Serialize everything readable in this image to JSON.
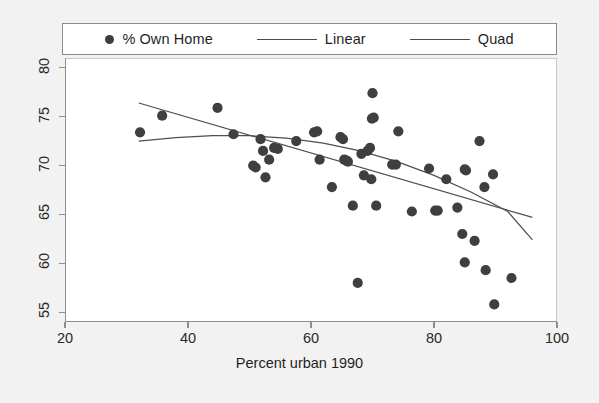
{
  "chart_data": {
    "type": "scatter",
    "title": "",
    "xlabel": "Percent urban 1990",
    "ylabel": "",
    "xlim": [
      20,
      100
    ],
    "ylim": [
      54,
      81
    ],
    "xticks": [
      20,
      40,
      60,
      80,
      100
    ],
    "yticks": [
      55,
      60,
      65,
      70,
      75,
      80
    ],
    "xtick_labels": [
      "20",
      "40",
      "60",
      "80",
      "100"
    ],
    "ytick_labels": [
      "55",
      "60",
      "65",
      "70",
      "75",
      "80"
    ],
    "grid": false,
    "legend_position": "top",
    "marker_color": "#3f3f3f",
    "line_color": "#4f4f4f",
    "background_color": "#ffffff",
    "page_background_color": "#f2f2f2",
    "series": [
      {
        "name": "% Own Home",
        "type": "scatter",
        "points": [
          [
            32.2,
            73.4
          ],
          [
            35.8,
            75.1
          ],
          [
            44.8,
            75.9
          ],
          [
            47.4,
            73.2
          ],
          [
            50.6,
            70.0
          ],
          [
            51.0,
            69.8
          ],
          [
            51.8,
            72.7
          ],
          [
            52.2,
            71.5
          ],
          [
            52.6,
            68.8
          ],
          [
            53.2,
            70.6
          ],
          [
            54.0,
            71.8
          ],
          [
            54.6,
            71.7
          ],
          [
            57.6,
            72.5
          ],
          [
            60.5,
            73.4
          ],
          [
            61.0,
            73.5
          ],
          [
            61.4,
            70.6
          ],
          [
            63.4,
            67.8
          ],
          [
            64.8,
            72.9
          ],
          [
            65.2,
            72.7
          ],
          [
            65.4,
            70.6
          ],
          [
            65.8,
            70.5
          ],
          [
            66.0,
            70.4
          ],
          [
            66.8,
            65.9
          ],
          [
            67.6,
            58.0
          ],
          [
            68.2,
            71.2
          ],
          [
            68.6,
            69.0
          ],
          [
            69.2,
            71.5
          ],
          [
            69.6,
            71.8
          ],
          [
            69.8,
            68.6
          ],
          [
            69.9,
            74.8
          ],
          [
            70.2,
            74.9
          ],
          [
            70.0,
            77.4
          ],
          [
            70.6,
            65.9
          ],
          [
            73.2,
            70.1
          ],
          [
            73.8,
            70.1
          ],
          [
            74.2,
            73.5
          ],
          [
            76.4,
            65.3
          ],
          [
            79.2,
            69.7
          ],
          [
            80.2,
            65.4
          ],
          [
            80.6,
            65.4
          ],
          [
            82.0,
            68.6
          ],
          [
            83.8,
            65.7
          ],
          [
            84.6,
            63.0
          ],
          [
            85.0,
            69.6
          ],
          [
            85.2,
            69.5
          ],
          [
            85.0,
            60.1
          ],
          [
            86.6,
            62.3
          ],
          [
            87.4,
            72.5
          ],
          [
            88.2,
            67.8
          ],
          [
            88.4,
            59.3
          ],
          [
            89.6,
            69.1
          ],
          [
            89.8,
            55.8
          ],
          [
            92.6,
            58.5
          ]
        ]
      },
      {
        "name": "Linear",
        "type": "line",
        "points": [
          [
            32.0,
            76.4
          ],
          [
            96.0,
            64.7
          ]
        ]
      },
      {
        "name": "Quad",
        "type": "line",
        "points": [
          [
            32.0,
            72.5
          ],
          [
            38.0,
            72.85
          ],
          [
            44.0,
            73.05
          ],
          [
            50.0,
            73.05
          ],
          [
            56.0,
            72.8
          ],
          [
            62.0,
            72.3
          ],
          [
            68.0,
            71.5
          ],
          [
            74.0,
            70.4
          ],
          [
            80.0,
            69.0
          ],
          [
            86.0,
            67.3
          ],
          [
            92.0,
            65.3
          ],
          [
            96.0,
            62.4
          ]
        ]
      }
    ]
  },
  "legend": {
    "entries": [
      {
        "label": "% Own Home",
        "glyph": "marker-dot-icon"
      },
      {
        "label": "Linear",
        "glyph": "line-sample-icon"
      },
      {
        "label": "Quad",
        "glyph": "line-sample-icon"
      }
    ]
  },
  "axis": {
    "x_title": "Percent urban 1990"
  }
}
